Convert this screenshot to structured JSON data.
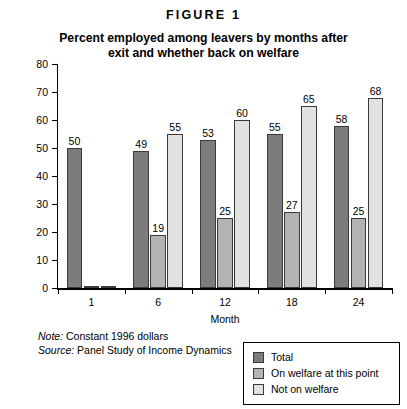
{
  "figure_label": "FIGURE 1",
  "title_line1": "Percent employed among leavers by months after",
  "title_line2": "exit and whether back on welfare",
  "notes": {
    "note_label": "Note:",
    "note_text": " Constant 1996 dollars",
    "source_label": "Source:",
    "source_text": " Panel Study of Income Dynamics"
  },
  "legend": {
    "items": [
      {
        "label": "Total",
        "color": "#7c7c7c"
      },
      {
        "label": "On welfare at this point",
        "color": "#b3b3b3"
      },
      {
        "label": "Not on welfare",
        "color": "#e2e2e2"
      }
    ]
  },
  "chart_data": {
    "type": "bar",
    "title": "Percent employed among leavers by months after exit and whether back on welfare",
    "xlabel": "Month",
    "ylabel": "Percent",
    "ylim": [
      0,
      80
    ],
    "yticks": [
      0,
      10,
      20,
      30,
      40,
      50,
      60,
      70,
      80
    ],
    "grid": false,
    "legend_position": "bottom-right",
    "categories": [
      "1",
      "6",
      "12",
      "18",
      "24"
    ],
    "series": [
      {
        "name": "Total",
        "color": "#7c7c7c",
        "values": [
          50,
          49,
          53,
          55,
          58
        ],
        "labels": [
          "50",
          "49",
          "53",
          "55",
          "58"
        ]
      },
      {
        "name": "On welfare at this point",
        "color": "#b3b3b3",
        "values": [
          0,
          19,
          25,
          27,
          25
        ],
        "labels": [
          "",
          "19",
          "25",
          "27",
          "25"
        ]
      },
      {
        "name": "Not on welfare",
        "color": "#e2e2e2",
        "values": [
          0,
          55,
          60,
          65,
          68
        ],
        "labels": [
          "",
          "55",
          "60",
          "65",
          "68"
        ]
      }
    ]
  }
}
